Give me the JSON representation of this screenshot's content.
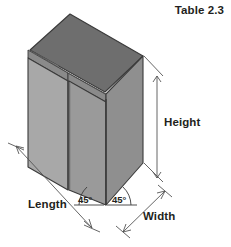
{
  "figure": {
    "caption": "Table 2.3",
    "object_type": "rectangular-box",
    "projection": "isometric",
    "dimension_labels": {
      "height": "Height",
      "length": "Length",
      "width": "Width"
    },
    "angle_labels": {
      "left": "45°",
      "right": "45°"
    },
    "colors": {
      "top_face": "#6e6e6e",
      "left_face": "#a8a8a8",
      "right_face": "#999999",
      "edge_band": "#8a8a8a",
      "outline": "#3a3a3a",
      "dimension_line": "#555555",
      "text": "#231f20",
      "background": "#ffffff"
    }
  }
}
